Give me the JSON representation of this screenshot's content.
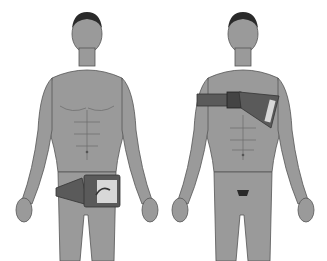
{
  "scene": {
    "description": "Two grayscale anatomical illustrations of a standing male figure wearing medical devices",
    "figures": [
      {
        "id": "left",
        "device": "pelvic-belt-device",
        "position": "lower-abdomen-hip"
      },
      {
        "id": "right",
        "device": "chest-strap-device",
        "position": "chest-shoulder"
      }
    ],
    "colors": {
      "background": "#ffffff",
      "skin": "#9a9a9a",
      "skin_shadow": "#7c7c7c",
      "outline": "#555555",
      "hair": "#2a2a2a",
      "device_dark": "#5a5a5a",
      "device_light": "#d8d8d8"
    }
  }
}
